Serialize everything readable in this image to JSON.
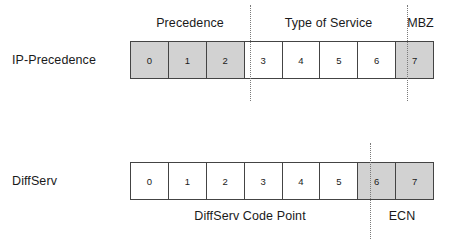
{
  "diagram": {
    "colors": {
      "shaded_cell": "#d2d2d2",
      "cell_border": "#444444",
      "separator": "#7a7a7a",
      "text": "#1a1a1a"
    },
    "rows": [
      {
        "id": "ip-precedence",
        "label": "IP-Precedence",
        "cells": [
          {
            "bit": "0",
            "shaded": true
          },
          {
            "bit": "1",
            "shaded": true
          },
          {
            "bit": "2",
            "shaded": true
          },
          {
            "bit": "3",
            "shaded": false
          },
          {
            "bit": "4",
            "shaded": false
          },
          {
            "bit": "5",
            "shaded": false
          },
          {
            "bit": "6",
            "shaded": false
          },
          {
            "bit": "7",
            "shaded": true
          }
        ],
        "captions_above": [
          {
            "id": "precedence",
            "text": "Precedence",
            "bits": "0-2"
          },
          {
            "id": "type-of-service",
            "text": "Type of Service",
            "bits": "3-6"
          },
          {
            "id": "mbz",
            "text": "MBZ",
            "bits": "7"
          }
        ],
        "captions_below": []
      },
      {
        "id": "diffserv",
        "label": "DiffServ",
        "cells": [
          {
            "bit": "0",
            "shaded": false
          },
          {
            "bit": "1",
            "shaded": false
          },
          {
            "bit": "2",
            "shaded": false
          },
          {
            "bit": "3",
            "shaded": false
          },
          {
            "bit": "4",
            "shaded": false
          },
          {
            "bit": "5",
            "shaded": false
          },
          {
            "bit": "6",
            "shaded": true
          },
          {
            "bit": "7",
            "shaded": true
          }
        ],
        "captions_above": [],
        "captions_below": [
          {
            "id": "dscp",
            "text": "DiffServ Code Point",
            "bits": "0-5"
          },
          {
            "id": "ecn",
            "text": "ECN",
            "bits": "6-7"
          }
        ]
      }
    ]
  }
}
